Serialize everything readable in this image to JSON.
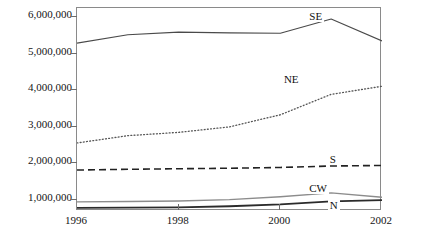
{
  "chart_data": {
    "type": "line",
    "title": "",
    "xlabel": "",
    "ylabel": "5th- to 8th-grade enrollment",
    "x": [
      1996,
      1997,
      1998,
      1999,
      2000,
      2001,
      2002
    ],
    "xlim": [
      1996,
      2002
    ],
    "ylim": [
      700000,
      6250000
    ],
    "xticks": [
      1996,
      1998,
      2000,
      2002
    ],
    "xtick_labels": [
      "1996",
      "1998",
      "2000",
      "2002"
    ],
    "yticks": [
      1000000,
      2000000,
      3000000,
      4000000,
      5000000,
      6000000
    ],
    "ytick_labels": [
      "1,000,000",
      "2,000,000",
      "3,000,000",
      "4,000,000",
      "5,000,000",
      "6,000,000"
    ],
    "grid": false,
    "legend_position": "inline-annotations",
    "series": [
      {
        "name": "SE",
        "label": "SE",
        "style": "solid",
        "color": "#4a4a4a",
        "width": 1.1,
        "values": [
          5290000,
          5520000,
          5590000,
          5570000,
          5560000,
          5950000,
          5350000
        ],
        "label_x": 2000.55,
        "label_y": 6010000
      },
      {
        "name": "NE",
        "label": "NE",
        "style": "dotted",
        "color": "#555555",
        "width": 1.3,
        "values": [
          2560000,
          2760000,
          2850000,
          3000000,
          3330000,
          3890000,
          4110000
        ],
        "label_x": 2000.05,
        "label_y": 4290000
      },
      {
        "name": "S",
        "label": "S",
        "style": "dashed",
        "color": "#222222",
        "width": 1.6,
        "values": [
          1820000,
          1840000,
          1855000,
          1870000,
          1890000,
          1930000,
          1945000
        ],
        "label_x": 2000.95,
        "label_y": 2090000
      },
      {
        "name": "CW",
        "label": "CW",
        "style": "solid",
        "color": "#8c8c8c",
        "width": 1.4,
        "values": [
          950000,
          960000,
          975000,
          1010000,
          1090000,
          1195000,
          1075000
        ],
        "label_x": 2000.55,
        "label_y": 1300000
      },
      {
        "name": "N",
        "label": "N",
        "style": "solid",
        "color": "#2b2b2b",
        "width": 1.8,
        "values": [
          785000,
          790000,
          800000,
          830000,
          880000,
          965000,
          1000000
        ],
        "label_x": 2000.95,
        "label_y": 840000
      }
    ]
  },
  "axis": {
    "y_title": "5th- to 8th-grade enrollment"
  }
}
